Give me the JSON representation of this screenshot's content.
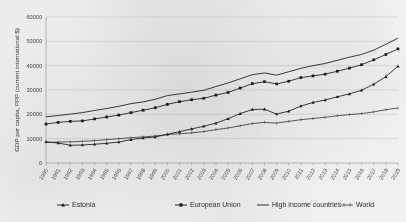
{
  "figure": {
    "background_color": "#fbfaf9",
    "line_color": "#1c1c1c",
    "grid_color": "#c9c9c9"
  },
  "chart_data": {
    "type": "line",
    "title": "",
    "xlabel": "",
    "ylabel": "GDP per capita, PPP (current international $)",
    "ylim": [
      0,
      60000
    ],
    "ytick_labels": [
      "0",
      "10000",
      "20000",
      "30000",
      "40000",
      "50000",
      "60000"
    ],
    "ytick_values": [
      0,
      10000,
      20000,
      30000,
      40000,
      50000,
      60000
    ],
    "grid": true,
    "legend_position": "bottom",
    "x": [
      1990,
      1991,
      1992,
      1993,
      1994,
      1995,
      1996,
      1997,
      1998,
      1999,
      2000,
      2001,
      2002,
      2003,
      2004,
      2005,
      2006,
      2007,
      2008,
      2009,
      2010,
      2011,
      2012,
      2013,
      2014,
      2015,
      2016,
      2017,
      2018,
      2019
    ],
    "xtick_labels": [
      "1990",
      "1991",
      "1992",
      "1993",
      "1994",
      "1995",
      "1996",
      "1997",
      "1998",
      "1999",
      "2000",
      "2001",
      "2002",
      "2003",
      "2004",
      "2005",
      "2006",
      "2007",
      "2008",
      "2009",
      "2010",
      "2011",
      "2012",
      "2013",
      "2014",
      "2015",
      "2016",
      "2017",
      "2018",
      "2019"
    ],
    "series": [
      {
        "name": "Estonia",
        "marker": "triangle",
        "values": [
          8700,
          8200,
          7300,
          7400,
          7700,
          8100,
          8600,
          9600,
          10300,
          10700,
          11800,
          12900,
          14000,
          15100,
          16400,
          18200,
          20300,
          22000,
          22100,
          20100,
          21300,
          23400,
          24900,
          25900,
          27200,
          28400,
          29900,
          32400,
          35500,
          39800
        ],
        "value_at_2019": 39800
      },
      {
        "name": "European Union",
        "marker": "square",
        "values": [
          16000,
          16700,
          17100,
          17300,
          18100,
          18900,
          19700,
          20700,
          21700,
          22700,
          24100,
          25200,
          26000,
          26600,
          27900,
          29000,
          30800,
          32600,
          33400,
          32500,
          33600,
          35100,
          35800,
          36500,
          37700,
          39000,
          40400,
          42400,
          44600,
          46900
        ],
        "value_at_2019": 46900
      },
      {
        "name": "High income countries",
        "marker": "none",
        "values": [
          19000,
          19500,
          20100,
          20700,
          21600,
          22400,
          23300,
          24400,
          25100,
          26200,
          27700,
          28400,
          29100,
          29900,
          31400,
          32900,
          34600,
          36300,
          37000,
          36100,
          37500,
          38900,
          40000,
          40900,
          42200,
          43500,
          44600,
          46400,
          48800,
          51300
        ],
        "value_at_2019": 51300
      },
      {
        "name": "World",
        "marker": "tick",
        "values": [
          8500,
          8600,
          8700,
          8900,
          9200,
          9600,
          10000,
          10400,
          10700,
          11100,
          11700,
          12000,
          12400,
          12900,
          13700,
          14400,
          15300,
          16200,
          16700,
          16400,
          17100,
          17800,
          18300,
          18800,
          19400,
          19900,
          20300,
          21000,
          21900,
          22600
        ],
        "value_at_2019": 22600
      }
    ]
  },
  "legend": {
    "items": [
      {
        "label": "Estonia",
        "marker": "triangle"
      },
      {
        "label": "European Union",
        "marker": "square"
      },
      {
        "label": "High income countries",
        "marker": "line"
      },
      {
        "label": "World",
        "marker": "tick"
      }
    ]
  }
}
